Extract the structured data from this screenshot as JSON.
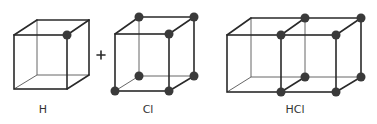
{
  "diagram": {
    "title": "",
    "colors": {
      "edge": "#2a2a2a",
      "atom": "#3a3a3a",
      "arrow": "#888888",
      "background": "#ffffff"
    },
    "operator_plus": "+",
    "arrow": "reaction-arrow",
    "cubes": [
      {
        "id": "H",
        "label": "H",
        "atoms": [
          "front-top-right"
        ]
      },
      {
        "id": "Cl",
        "label": "Cl",
        "atoms": [
          "back-top-left",
          "back-top-right",
          "front-top-right",
          "back-bottom-left",
          "back-bottom-right",
          "front-bottom-left",
          "front-bottom-right"
        ]
      },
      {
        "id": "HCl",
        "label": "HCl",
        "atoms": [
          "shared-face-top-front",
          "shared-face-top-back",
          "shared-face-bottom-front",
          "shared-face-bottom-back",
          "right-top-front",
          "right-top-back",
          "right-bottom-front",
          "right-bottom-back"
        ]
      }
    ]
  }
}
